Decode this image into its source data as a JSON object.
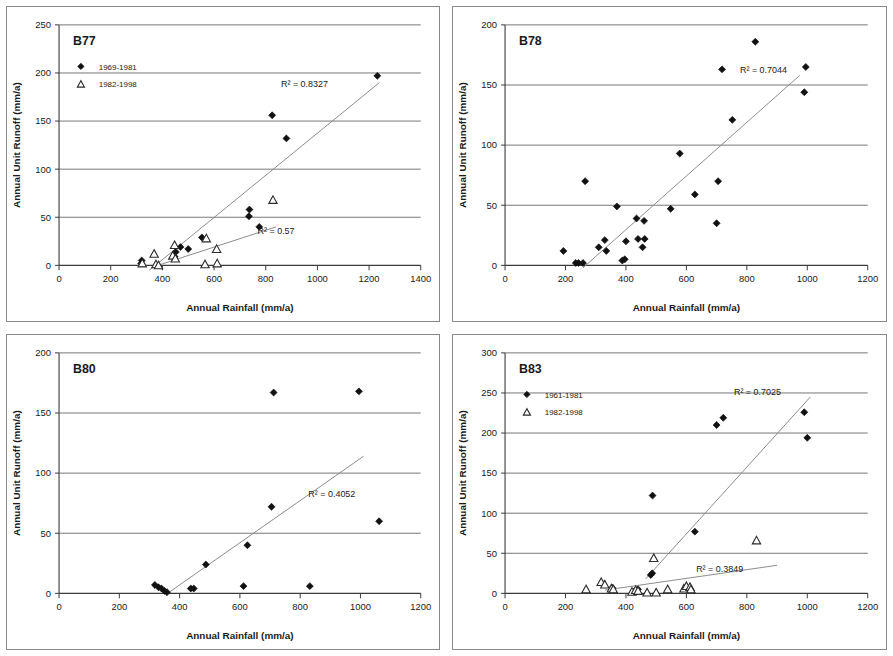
{
  "figure": {
    "background": "#ffffff",
    "panel_border_color": "#8a8a8a",
    "marker_colors": {
      "series1": "#111111",
      "series2_outline": "#2b2b2b",
      "trendline": "#8c8c8c"
    }
  },
  "common": {
    "xlabel": "Annual Rainfall (mm/a)",
    "ylabel": "Annual Unit Runoff (mm/a)"
  },
  "chart_data": [
    {
      "type": "scatter",
      "panel": "B77",
      "title": "B77",
      "xlabel": "Annual Rainfall (mm/a)",
      "ylabel": "Annual Unit Runoff (mm/a)",
      "xlim": [
        0,
        1400
      ],
      "ylim": [
        0,
        250
      ],
      "xticks": [
        0,
        200,
        400,
        600,
        800,
        1000,
        1200,
        1400
      ],
      "yticks": [
        0,
        50,
        100,
        150,
        200,
        250
      ],
      "grid": true,
      "legend_position": "upper-left",
      "legend": [
        "1969-1981",
        "1982-1998"
      ],
      "annotations": [
        {
          "text": "R² = 0.8327",
          "x": 950,
          "y": 185
        },
        {
          "text": "R² = 0.57",
          "x": 840,
          "y": 33
        }
      ],
      "series": [
        {
          "name": "1969-1981",
          "marker": "diamond",
          "points": [
            [
              318,
              2
            ],
            [
              320,
              5
            ],
            [
              448,
              9
            ],
            [
              452,
              14
            ],
            [
              470,
              19
            ],
            [
              500,
              17
            ],
            [
              553,
              29
            ],
            [
              735,
              51
            ],
            [
              737,
              58
            ],
            [
              775,
              40
            ],
            [
              825,
              156
            ],
            [
              880,
              132
            ],
            [
              1232,
              197
            ]
          ],
          "trendline": {
            "x1": 350,
            "y1": -5,
            "x2": 1240,
            "y2": 190
          }
        },
        {
          "name": "1982-1998",
          "marker": "triangle",
          "points": [
            [
              322,
              2
            ],
            [
              368,
              12
            ],
            [
              375,
              1
            ],
            [
              385,
              0
            ],
            [
              440,
              10
            ],
            [
              447,
              21
            ],
            [
              450,
              7
            ],
            [
              565,
              1
            ],
            [
              570,
              28
            ],
            [
              610,
              17
            ],
            [
              612,
              2
            ],
            [
              828,
              68
            ]
          ],
          "trendline": {
            "x1": 360,
            "y1": -2,
            "x2": 840,
            "y2": 40
          }
        }
      ]
    },
    {
      "type": "scatter",
      "panel": "B78",
      "title": "B78",
      "xlabel": "Annual Rainfall (mm/a)",
      "ylabel": "Annual Unit Runoff (mm/a)",
      "xlim": [
        0,
        1200
      ],
      "ylim": [
        0,
        200
      ],
      "xticks": [
        0,
        200,
        400,
        600,
        800,
        1000,
        1200
      ],
      "yticks": [
        0,
        50,
        100,
        150,
        200
      ],
      "grid": true,
      "legend_position": "none",
      "legend": [],
      "annotations": [
        {
          "text": "R² = 0.7044",
          "x": 855,
          "y": 160
        }
      ],
      "series": [
        {
          "name": "annual values",
          "marker": "diamond",
          "points": [
            [
              193,
              12
            ],
            [
              234,
              2
            ],
            [
              243,
              2
            ],
            [
              258,
              2
            ],
            [
              265,
              70
            ],
            [
              310,
              15
            ],
            [
              330,
              21
            ],
            [
              335,
              12
            ],
            [
              370,
              49
            ],
            [
              388,
              4
            ],
            [
              396,
              5
            ],
            [
              400,
              20
            ],
            [
              435,
              39
            ],
            [
              440,
              22
            ],
            [
              455,
              15
            ],
            [
              460,
              37
            ],
            [
              462,
              22
            ],
            [
              548,
              47
            ],
            [
              578,
              93
            ],
            [
              628,
              59
            ],
            [
              700,
              35
            ],
            [
              705,
              70
            ],
            [
              718,
              163
            ],
            [
              752,
              121
            ],
            [
              828,
              186
            ],
            [
              990,
              144
            ],
            [
              995,
              165
            ]
          ],
          "trendline": {
            "x1": 258,
            "y1": -2,
            "x2": 975,
            "y2": 158
          }
        }
      ]
    },
    {
      "type": "scatter",
      "panel": "B80",
      "title": "B80",
      "xlabel": "Annual Rainfall (mm/a)",
      "ylabel": "Annual Unit Runoff (mm/a)",
      "xlim": [
        0,
        1200
      ],
      "ylim": [
        0,
        200
      ],
      "xticks": [
        0,
        200,
        400,
        600,
        800,
        1000,
        1200
      ],
      "yticks": [
        0,
        50,
        100,
        150,
        200
      ],
      "grid": true,
      "legend_position": "none",
      "legend": [],
      "annotations": [
        {
          "text": "R² = 0.4052",
          "x": 905,
          "y": 80
        }
      ],
      "series": [
        {
          "name": "annual values",
          "marker": "diamond",
          "points": [
            [
              318,
              7
            ],
            [
              330,
              5
            ],
            [
              340,
              4
            ],
            [
              350,
              2
            ],
            [
              358,
              1
            ],
            [
              437,
              4
            ],
            [
              447,
              4
            ],
            [
              487,
              24
            ],
            [
              612,
              6
            ],
            [
              625,
              40
            ],
            [
              705,
              72
            ],
            [
              712,
              167
            ],
            [
              832,
              6
            ],
            [
              995,
              168
            ],
            [
              1062,
              60
            ]
          ],
          "trendline": {
            "x1": 360,
            "y1": 0,
            "x2": 1010,
            "y2": 114
          }
        }
      ]
    },
    {
      "type": "scatter",
      "panel": "B83",
      "title": "B83",
      "xlabel": "Annual Rainfall (mm/a)",
      "ylabel": "Annual Unit Runoff (mm/a)",
      "xlim": [
        0,
        1200
      ],
      "ylim": [
        0,
        300
      ],
      "xticks": [
        0,
        200,
        400,
        600,
        800,
        1000,
        1200
      ],
      "yticks": [
        0,
        50,
        100,
        150,
        200,
        250,
        300
      ],
      "grid": true,
      "legend_position": "upper-left",
      "legend": [
        "1961-1981",
        "1982-1998"
      ],
      "annotations": [
        {
          "text": "R² = 0.7025",
          "x": 835,
          "y": 248
        },
        {
          "text": "R² = 0.3849",
          "x": 710,
          "y": 27
        }
      ],
      "series": [
        {
          "name": "1961-1981",
          "marker": "diamond",
          "points": [
            [
              355,
              7
            ],
            [
              432,
              4
            ],
            [
              440,
              5
            ],
            [
              482,
              23
            ],
            [
              487,
              25
            ],
            [
              488,
              122
            ],
            [
              628,
              77
            ],
            [
              700,
              210
            ],
            [
              722,
              219
            ],
            [
              990,
              226
            ],
            [
              1000,
              194
            ]
          ],
          "trendline": {
            "x1": 465,
            "y1": 18,
            "x2": 1010,
            "y2": 245
          }
        },
        {
          "name": "1982-1998",
          "marker": "triangle",
          "points": [
            [
              268,
              5
            ],
            [
              318,
              14
            ],
            [
              330,
              11
            ],
            [
              352,
              6
            ],
            [
              358,
              5
            ],
            [
              420,
              2
            ],
            [
              432,
              4
            ],
            [
              440,
              3
            ],
            [
              470,
              1
            ],
            [
              492,
              44
            ],
            [
              500,
              1
            ],
            [
              538,
              5
            ],
            [
              592,
              6
            ],
            [
              600,
              9
            ],
            [
              612,
              8
            ],
            [
              615,
              5
            ],
            [
              832,
              66
            ]
          ],
          "trendline": {
            "x1": 330,
            "y1": 4,
            "x2": 900,
            "y2": 35
          }
        }
      ]
    }
  ]
}
